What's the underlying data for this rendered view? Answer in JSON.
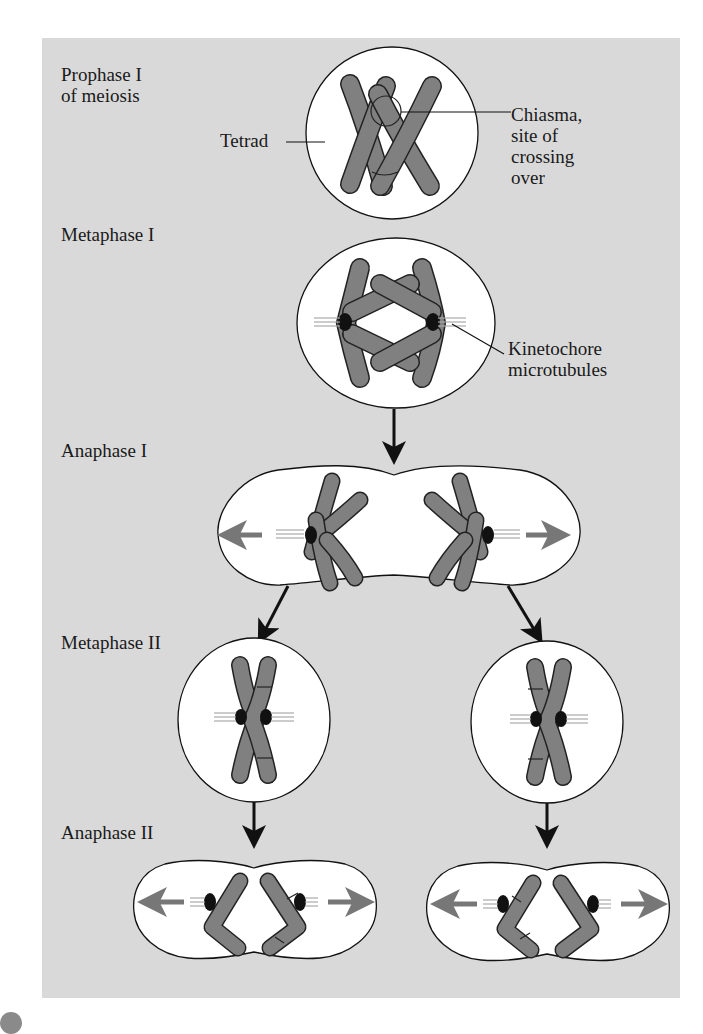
{
  "figure": {
    "background_color": "#d9d9d9",
    "chromosome_color": "#808080",
    "kinetochore_color": "#111111"
  },
  "stages": {
    "prophase1": {
      "label": "Prophase I\nof meiosis"
    },
    "metaphase1": {
      "label": "Metaphase I"
    },
    "anaphase1": {
      "label": "Anaphase I"
    },
    "metaphase2": {
      "label": "Metaphase II"
    },
    "anaphase2": {
      "label": "Anaphase II"
    }
  },
  "annotations": {
    "tetrad": "Tetrad",
    "chiasma": "Chiasma,\nsite of\ncrossing\nover",
    "kinetochore": "Kinetochore\nmicrotubules"
  }
}
